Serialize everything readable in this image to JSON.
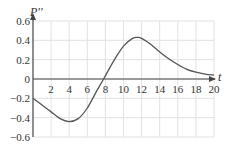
{
  "chart_data": {
    "type": "line",
    "title": "",
    "xlabel": "t",
    "ylabel": "P''",
    "xlim": [
      0,
      20
    ],
    "ylim": [
      -0.6,
      0.6
    ],
    "grid": true,
    "x_ticks": [
      "2",
      "4",
      "6",
      "8",
      "10",
      "12",
      "14",
      "16",
      "18",
      "20"
    ],
    "y_ticks": [
      "0.6",
      "0.4",
      "0.2",
      "0",
      "-0.2",
      "-0.4",
      "-0.6"
    ],
    "series": [
      {
        "name": "P''(t)",
        "x": [
          0,
          1,
          2,
          3,
          4,
          5,
          6,
          7,
          7.8,
          9,
          10,
          11,
          11.6,
          12,
          13,
          14,
          15,
          16,
          17,
          18,
          19,
          20
        ],
        "y": [
          -0.2,
          -0.27,
          -0.34,
          -0.41,
          -0.44,
          -0.41,
          -0.3,
          -0.13,
          0,
          0.2,
          0.34,
          0.42,
          0.43,
          0.42,
          0.36,
          0.28,
          0.21,
          0.15,
          0.1,
          0.07,
          0.05,
          0.04
        ]
      }
    ]
  }
}
